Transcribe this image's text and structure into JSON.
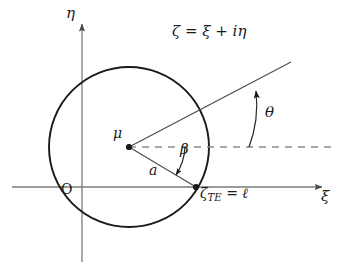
{
  "figure": {
    "width": 341,
    "height": 268,
    "background": "#ffffff",
    "stroke_color": "#1a1a1a",
    "axis_color": "#7a7a7a",
    "dash_color": "#8a8a8a"
  },
  "axes": {
    "vertical_label": "η",
    "horizontal_label": "ξ",
    "origin_label": "O",
    "origin_x": 82,
    "origin_y": 187
  },
  "equation": {
    "text": "ζ = ξ + iη"
  },
  "circle": {
    "center_label": "μ",
    "center_x": 129,
    "center_y": 147,
    "radius": 80,
    "radius_label": "a"
  },
  "angles": {
    "beta_label": "β",
    "theta_label": "θ"
  },
  "trailing_edge": {
    "symbol": "ζ",
    "subscript": "TE",
    "equals": " = ",
    "value": "ℓ",
    "x": 196,
    "y": 187
  }
}
